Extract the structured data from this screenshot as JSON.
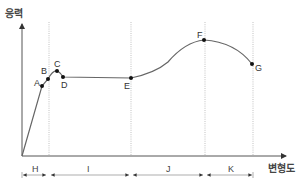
{
  "diagram": {
    "y_axis_label": "응력",
    "x_axis_label": "변형도",
    "points": [
      {
        "id": "A",
        "label": "A"
      },
      {
        "id": "B",
        "label": "B"
      },
      {
        "id": "C",
        "label": "C"
      },
      {
        "id": "D",
        "label": "D"
      },
      {
        "id": "E",
        "label": "E"
      },
      {
        "id": "F",
        "label": "F"
      },
      {
        "id": "G",
        "label": "G"
      }
    ],
    "regions": [
      {
        "id": "H",
        "label": "H"
      },
      {
        "id": "I",
        "label": "I"
      },
      {
        "id": "J",
        "label": "J"
      },
      {
        "id": "K",
        "label": "K"
      }
    ],
    "colors": {
      "axis": "#555555",
      "curve": "#666666",
      "point": "#111111",
      "guide": "#999999"
    }
  }
}
